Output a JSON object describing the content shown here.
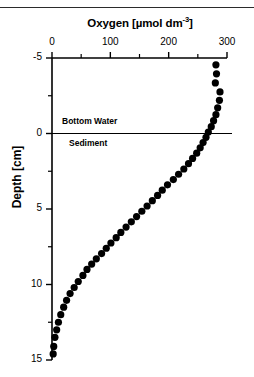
{
  "figure": {
    "ylabel": "Depth [cm]",
    "interface_labels": {
      "above": "Bottom Water",
      "below": "Sediment"
    }
  },
  "chart_data": {
    "type": "scatter",
    "title": "Oxygen [µmol dm",
    "title_exponent": "-3",
    "title_suffix": "]",
    "title_full": "Oxygen [µmol dm-3]",
    "xlabel": "Oxygen [µmol dm-3]",
    "ylabel": "Depth [cm]",
    "xlim": [
      0,
      300
    ],
    "ylim": [
      -5,
      15
    ],
    "y_inverted": true,
    "grid": false,
    "legend": null,
    "x_ticks_major": [
      0,
      100,
      200,
      300
    ],
    "x_tick_labels": [
      "0",
      "100",
      "200",
      "300"
    ],
    "x_ticks_minor": [
      50,
      150,
      250
    ],
    "y_ticks_major": [
      -5,
      0,
      5,
      10,
      15
    ],
    "y_tick_labels": [
      "-5",
      "0",
      "5",
      "10",
      "15"
    ],
    "y_ticks_minor": [
      -2.5,
      2.5,
      7.5,
      12.5
    ],
    "marker": "filled-circle",
    "marker_color": "#000000",
    "annotations": [
      {
        "text": "Bottom Water",
        "depth": -0.8
      },
      {
        "text": "Sediment",
        "depth": 0.8
      }
    ],
    "reference_lines": [
      {
        "axis": "y",
        "value": 0,
        "label": "sediment-water interface"
      }
    ],
    "series": [
      {
        "name": "Oxygen profile",
        "x": [
          281,
          282,
          280,
          288,
          287,
          284,
          281,
          277,
          273,
          268,
          264,
          259,
          254,
          248,
          241,
          234,
          226,
          217,
          208,
          198,
          189,
          181,
          172,
          163,
          154,
          145,
          136,
          127,
          118,
          110,
          101,
          93,
          85,
          76,
          68,
          60,
          53,
          45,
          38,
          31,
          25,
          20,
          15,
          11,
          8,
          5,
          3,
          2
        ],
        "y": [
          -4.55,
          -3.95,
          -3.35,
          -2.75,
          -2.2,
          -1.7,
          -1.25,
          -0.85,
          -0.45,
          -0.1,
          0.25,
          0.6,
          0.95,
          1.3,
          1.65,
          2.0,
          2.35,
          2.7,
          3.05,
          3.4,
          3.75,
          4.1,
          4.45,
          4.8,
          5.15,
          5.5,
          5.85,
          6.2,
          6.55,
          6.9,
          7.25,
          7.6,
          7.95,
          8.3,
          8.65,
          9.0,
          9.4,
          9.8,
          10.2,
          10.6,
          11.05,
          11.5,
          12.0,
          12.5,
          13.0,
          13.5,
          14.1,
          14.6
        ],
        "x_label": "Oxygen concentration",
        "y_label": "Depth below sediment-water interface"
      }
    ]
  }
}
